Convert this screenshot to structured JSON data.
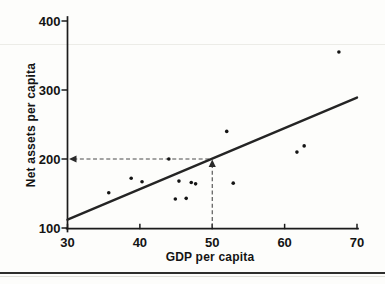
{
  "figure": {
    "background": "#fdfdfb",
    "ink": "#1b1b1b"
  },
  "chart_data": {
    "type": "scatter",
    "title": "",
    "xlabel": "GDP per capita",
    "ylabel": "Net assets per capita",
    "xlim": [
      30,
      70
    ],
    "ylim": [
      100,
      400
    ],
    "x_ticks": [
      30,
      40,
      50,
      60,
      70
    ],
    "y_ticks": [
      100,
      200,
      300,
      400
    ],
    "grid": false,
    "points": [
      {
        "x": 35.7,
        "y": 151
      },
      {
        "x": 38.8,
        "y": 172
      },
      {
        "x": 40.3,
        "y": 167
      },
      {
        "x": 44.0,
        "y": 200
      },
      {
        "x": 44.9,
        "y": 142
      },
      {
        "x": 45.4,
        "y": 168
      },
      {
        "x": 46.4,
        "y": 143
      },
      {
        "x": 47.1,
        "y": 166
      },
      {
        "x": 47.7,
        "y": 164
      },
      {
        "x": 52.0,
        "y": 240
      },
      {
        "x": 52.9,
        "y": 165
      },
      {
        "x": 61.7,
        "y": 210
      },
      {
        "x": 62.7,
        "y": 219
      },
      {
        "x": 67.5,
        "y": 355
      }
    ],
    "trendline": {
      "x1": 30,
      "y1": 112,
      "x2": 70,
      "y2": 289
    },
    "guides": {
      "x": 50,
      "y": 200
    }
  }
}
